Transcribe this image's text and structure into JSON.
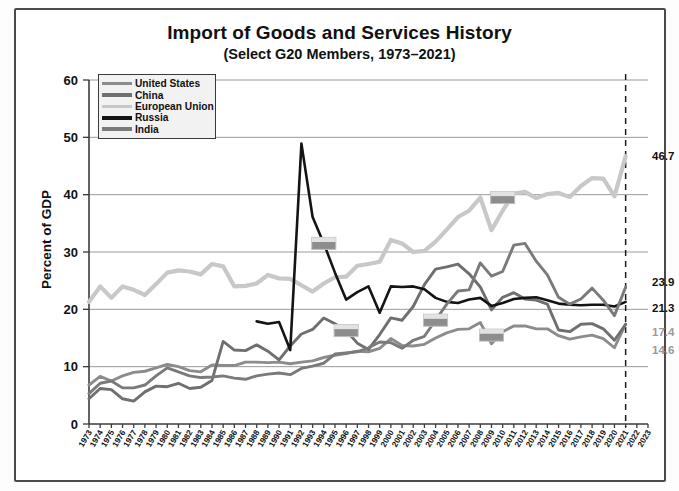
{
  "chart_data": {
    "type": "line",
    "title": "Import of Goods and Services History",
    "subtitle": "(Select G20 Members, 1973–2021)",
    "xlabel": "",
    "ylabel": "Percent of GDP",
    "ylim": [
      0,
      60
    ],
    "yticks": [
      0,
      10,
      20,
      30,
      40,
      50,
      60
    ],
    "xlim": [
      1973,
      2023
    ],
    "grid": true,
    "legend_position": "top-left",
    "annotation_line": {
      "x": 2021,
      "style": "dashed",
      "label": ""
    },
    "x": [
      1973,
      1974,
      1975,
      1976,
      1977,
      1978,
      1979,
      1980,
      1981,
      1982,
      1983,
      1984,
      1985,
      1986,
      1987,
      1988,
      1989,
      1990,
      1991,
      1992,
      1993,
      1994,
      1995,
      1996,
      1997,
      1998,
      1999,
      2000,
      2001,
      2002,
      2003,
      2004,
      2005,
      2006,
      2007,
      2008,
      2009,
      2010,
      2011,
      2012,
      2013,
      2014,
      2015,
      2016,
      2017,
      2018,
      2019,
      2020,
      2021
    ],
    "xticks": [
      1973,
      1974,
      1975,
      1976,
      1977,
      1978,
      1979,
      1980,
      1981,
      1982,
      1983,
      1984,
      1985,
      1986,
      1987,
      1988,
      1989,
      1990,
      1991,
      1992,
      1993,
      1994,
      1995,
      1996,
      1997,
      1998,
      1999,
      2000,
      2001,
      2002,
      2003,
      2004,
      2005,
      2006,
      2007,
      2008,
      2009,
      2010,
      2011,
      2012,
      2013,
      2014,
      2015,
      2016,
      2017,
      2018,
      2019,
      2020,
      2021,
      2022,
      2023
    ],
    "series": [
      {
        "name": "United States",
        "color": "#8c8c8c",
        "end_label": "17.4",
        "end_value": 17.4,
        "values": [
          6.8,
          8.3,
          7.5,
          8.4,
          9.0,
          9.2,
          9.8,
          10.4,
          10.0,
          9.3,
          9.1,
          10.3,
          10.2,
          10.2,
          10.8,
          10.8,
          10.7,
          10.8,
          10.5,
          10.8,
          11.0,
          11.6,
          12.0,
          12.3,
          12.7,
          12.6,
          13.2,
          14.9,
          13.7,
          13.6,
          13.9,
          15.0,
          15.9,
          16.5,
          16.6,
          17.7,
          14.0,
          16.1,
          17.1,
          17.1,
          16.6,
          16.6,
          15.4,
          14.8,
          15.2,
          15.5,
          14.9,
          13.3,
          17.4
        ]
      },
      {
        "name": "China",
        "color": "#6f6f6f",
        "end_label": "17.4",
        "end_value": 17.4,
        "values": [
          4.4,
          6.2,
          6.0,
          4.4,
          4.0,
          5.6,
          6.6,
          6.5,
          7.1,
          6.2,
          6.4,
          7.6,
          14.4,
          12.9,
          12.8,
          13.8,
          12.7,
          11.2,
          13.6,
          15.7,
          16.5,
          18.5,
          17.5,
          16.3,
          14.1,
          13.0,
          15.6,
          18.5,
          18.1,
          20.5,
          24.3,
          27.0,
          27.4,
          27.9,
          26.2,
          23.9,
          19.9,
          22.1,
          22.9,
          21.8,
          21.6,
          20.9,
          16.4,
          16.1,
          17.4,
          17.5,
          16.6,
          14.6,
          17.4
        ]
      },
      {
        "name": "European Union",
        "color": "#c8c8c8",
        "end_label": "46.7",
        "end_value": 46.7,
        "values": [
          21.3,
          24.0,
          22.0,
          24.0,
          23.4,
          22.5,
          24.4,
          26.4,
          26.8,
          26.6,
          26.1,
          27.9,
          27.5,
          24.0,
          24.1,
          24.5,
          26.0,
          25.4,
          25.3,
          24.2,
          23.1,
          24.5,
          25.6,
          25.7,
          27.6,
          27.9,
          28.3,
          32.1,
          31.5,
          30.0,
          30.2,
          31.8,
          33.9,
          36.1,
          37.2,
          39.5,
          33.8,
          37.2,
          40.2,
          40.5,
          39.4,
          40.1,
          40.3,
          39.6,
          41.5,
          42.9,
          42.8,
          39.7,
          46.7
        ]
      },
      {
        "name": "Russia",
        "color": "#141414",
        "end_label": "21.3",
        "end_value": 21.3,
        "values": [
          null,
          null,
          null,
          null,
          null,
          null,
          null,
          null,
          null,
          null,
          null,
          null,
          null,
          null,
          null,
          17.9,
          17.5,
          17.8,
          12.9,
          48.9,
          36.1,
          31.5,
          26.4,
          21.7,
          23.0,
          24.0,
          19.4,
          24.0,
          23.9,
          24.0,
          23.5,
          22.0,
          21.3,
          21.1,
          21.7,
          22.0,
          20.6,
          21.1,
          21.8,
          22.0,
          22.1,
          21.6,
          21.0,
          20.8,
          20.7,
          20.8,
          20.8,
          20.5,
          21.3
        ]
      },
      {
        "name": "India",
        "color": "#7a7a7a",
        "end_label": "23.9",
        "end_value": 23.9,
        "values": [
          5.3,
          7.1,
          7.5,
          6.3,
          6.3,
          6.8,
          8.4,
          9.8,
          9.1,
          8.4,
          8.1,
          8.2,
          8.4,
          8.0,
          7.8,
          8.4,
          8.7,
          8.9,
          8.6,
          9.7,
          10.1,
          10.6,
          12.2,
          12.4,
          12.6,
          13.3,
          14.3,
          14.2,
          13.2,
          14.6,
          15.3,
          18.1,
          20.9,
          23.2,
          23.4,
          28.1,
          25.8,
          26.6,
          31.2,
          31.5,
          28.4,
          26.0,
          22.1,
          20.9,
          21.8,
          23.7,
          21.6,
          18.9,
          23.9
        ]
      }
    ],
    "markers": [
      {
        "series": "Russia",
        "flag": "russia-flag",
        "x": 1994,
        "y": 31.5
      },
      {
        "series": "China",
        "flag": "china-flag",
        "x": 1996,
        "y": 16.3
      },
      {
        "series": "India",
        "flag": "india-flag",
        "x": 2004,
        "y": 18.1
      },
      {
        "series": "United States",
        "flag": "us-flag",
        "x": 2009,
        "y": 15.5
      },
      {
        "series": "European Union",
        "flag": "eu-flag",
        "x": 2010,
        "y": 39.5
      }
    ]
  }
}
